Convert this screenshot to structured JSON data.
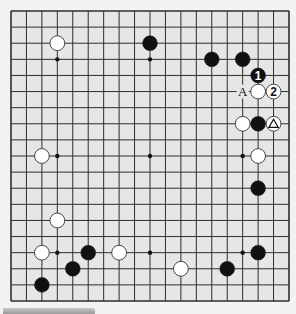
{
  "board": {
    "size": 19,
    "colors": {
      "background": "#e6e6e6",
      "line": "#2e2e2e",
      "black_stone": "#111111",
      "white_stone": "#ffffff",
      "white_stone_edge": "#333333",
      "star_point": "#111111"
    },
    "star_points": [
      [
        3,
        3
      ],
      [
        9,
        3
      ],
      [
        15,
        3
      ],
      [
        3,
        9
      ],
      [
        9,
        9
      ],
      [
        15,
        9
      ],
      [
        3,
        15
      ],
      [
        9,
        15
      ],
      [
        15,
        15
      ]
    ],
    "stones": [
      {
        "color": "white",
        "col": 3,
        "row": 2
      },
      {
        "color": "black",
        "col": 9,
        "row": 2
      },
      {
        "color": "black",
        "col": 13,
        "row": 3
      },
      {
        "color": "black",
        "col": 15,
        "row": 3
      },
      {
        "color": "black",
        "col": 16,
        "row": 4,
        "label": "1"
      },
      {
        "color": "white",
        "col": 16,
        "row": 5
      },
      {
        "color": "white",
        "col": 17,
        "row": 5,
        "label": "2"
      },
      {
        "color": "white",
        "col": 15,
        "row": 7
      },
      {
        "color": "black",
        "col": 16,
        "row": 7
      },
      {
        "color": "white",
        "col": 17,
        "row": 7,
        "mark": "triangle"
      },
      {
        "color": "white",
        "col": 2,
        "row": 9
      },
      {
        "color": "white",
        "col": 16,
        "row": 9
      },
      {
        "color": "black",
        "col": 16,
        "row": 11
      },
      {
        "color": "white",
        "col": 3,
        "row": 13
      },
      {
        "color": "white",
        "col": 2,
        "row": 15
      },
      {
        "color": "black",
        "col": 5,
        "row": 15
      },
      {
        "color": "white",
        "col": 7,
        "row": 15
      },
      {
        "color": "black",
        "col": 16,
        "row": 15
      },
      {
        "color": "black",
        "col": 4,
        "row": 16
      },
      {
        "color": "white",
        "col": 11,
        "row": 16
      },
      {
        "color": "black",
        "col": 14,
        "row": 16
      },
      {
        "color": "black",
        "col": 2,
        "row": 17
      }
    ],
    "point_labels": [
      {
        "text": "A",
        "col": 15,
        "row": 5
      }
    ]
  }
}
